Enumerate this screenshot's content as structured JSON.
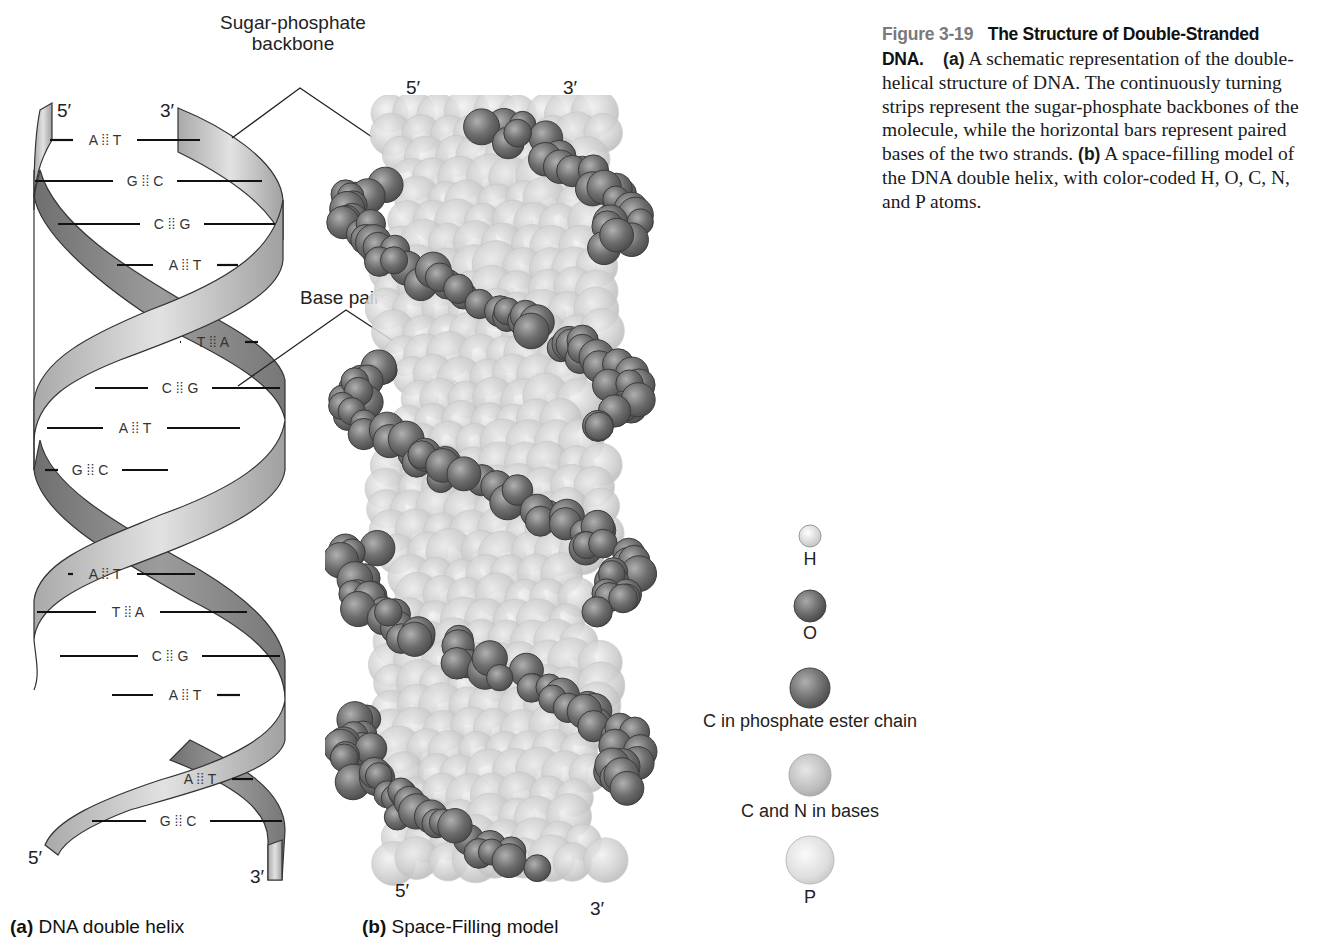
{
  "caption": {
    "figure_number": "Figure 3-19",
    "title": "The Structure of Double-Stranded DNA.",
    "part_a_tag": "(a)",
    "part_a_text": "A schematic representation of the double-helical structure of DNA. The continuously turning strips represent the sugar-phosphate backbones of the molecule, while the horizontal bars represent paired bases of the two strands.",
    "part_b_tag": "(b)",
    "part_b_text": "A space-filling model of the DNA double helix, with color-coded H, O, C, N, and P atoms."
  },
  "panel_a": {
    "tag": "(a)",
    "label": "DNA double helix",
    "top_left_end": "5′",
    "top_right_end": "3′",
    "bottom_left_end": "5′",
    "bottom_right_end": "3′",
    "base_pairs": [
      {
        "left": "A",
        "bond": "⁞⁞",
        "right": "T",
        "y": 140,
        "x1": 50,
        "x2": 200,
        "lx": 105
      },
      {
        "left": "G",
        "bond": "⁞⁞",
        "right": "C",
        "y": 181,
        "x1": 35,
        "x2": 262,
        "lx": 145
      },
      {
        "left": "C",
        "bond": "⁞⁞",
        "right": "G",
        "y": 224,
        "x1": 58,
        "x2": 275,
        "lx": 172
      },
      {
        "left": "A",
        "bond": "⁞⁞",
        "right": "T",
        "y": 265,
        "x1": 117,
        "x2": 238,
        "lx": 185
      },
      {
        "left": "T",
        "bond": "⁞⁞",
        "right": "A",
        "y": 342,
        "x1": 180,
        "x2": 258,
        "lx": 213
      },
      {
        "left": "C",
        "bond": "⁞⁞",
        "right": "G",
        "y": 388,
        "x1": 95,
        "x2": 280,
        "lx": 180
      },
      {
        "left": "A",
        "bond": "⁞⁞",
        "right": "T",
        "y": 428,
        "x1": 47,
        "x2": 240,
        "lx": 135
      },
      {
        "left": "G",
        "bond": "⁞⁞",
        "right": "C",
        "y": 470,
        "x1": 45,
        "x2": 168,
        "lx": 90
      },
      {
        "left": "A",
        "bond": "⁞⁞",
        "right": "T",
        "y": 574,
        "x1": 68,
        "x2": 195,
        "lx": 105
      },
      {
        "left": "T",
        "bond": "⁞⁞",
        "right": "A",
        "y": 612,
        "x1": 37,
        "x2": 247,
        "lx": 128
      },
      {
        "left": "C",
        "bond": "⁞⁞",
        "right": "G",
        "y": 656,
        "x1": 60,
        "x2": 280,
        "lx": 170
      },
      {
        "left": "A",
        "bond": "⁞⁞",
        "right": "T",
        "y": 695,
        "x1": 112,
        "x2": 240,
        "lx": 185
      },
      {
        "left": "A",
        "bond": "⁞⁞",
        "right": "T",
        "y": 779,
        "x1": 168,
        "x2": 253,
        "lx": 200
      },
      {
        "left": "G",
        "bond": "⁞⁞",
        "right": "C",
        "y": 821,
        "x1": 92,
        "x2": 282,
        "lx": 178
      }
    ]
  },
  "callouts": {
    "backbone_line1": "Sugar-phosphate",
    "backbone_line2": "backbone",
    "base_pairs": "Base pairs"
  },
  "panel_b": {
    "tag": "(b)",
    "label": "Space-Filling model",
    "top_left_end": "5′",
    "top_right_end": "3′",
    "bottom_left_end": "5′",
    "bottom_right_end": "3′"
  },
  "legend": {
    "items": [
      {
        "atom": "H",
        "label": "H",
        "color": "#d9d9d9",
        "size": 22
      },
      {
        "atom": "O",
        "label": "O",
        "color": "#6e6e6e",
        "size": 34
      },
      {
        "atom": "C-backbone",
        "label": "C in phosphate ester chain",
        "color": "#707070",
        "size": 42
      },
      {
        "atom": "C-N-bases",
        "label": "C and N in bases",
        "color": "#bdbdbd",
        "size": 44
      },
      {
        "atom": "P",
        "label": "P",
        "color": "#dcdcdc",
        "size": 50
      }
    ]
  },
  "colors": {
    "ribbon_light": "#d6d6d6",
    "ribbon_dark": "#8a8a8a",
    "backbone_atom": "#6e6e6e",
    "base_atom": "#c4c4c4",
    "text": "#222222",
    "caption_number": "#7a7a7a"
  }
}
